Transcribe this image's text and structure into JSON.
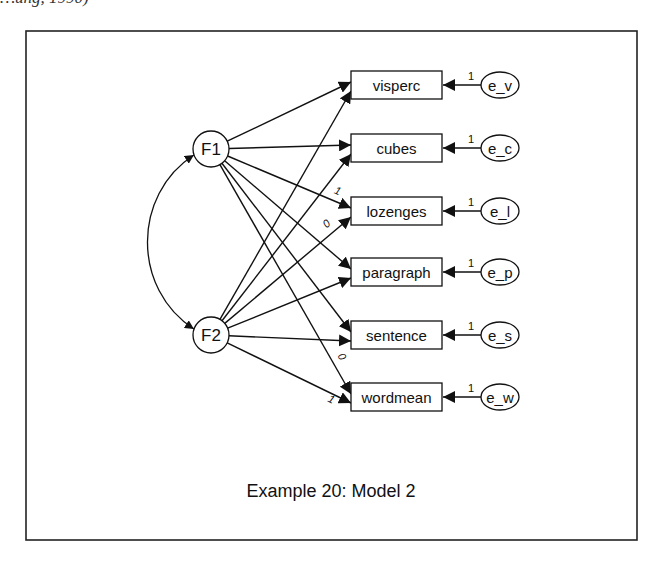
{
  "header_fragment": "…ung, 1990)",
  "caption": "Example 20: Model 2",
  "frame": {
    "x": 26,
    "y": 31,
    "w": 611,
    "h": 509
  },
  "factors": [
    {
      "id": "F1",
      "label": "F1",
      "cx": 211,
      "cy": 149,
      "r": 18
    },
    {
      "id": "F2",
      "label": "F2",
      "cx": 211,
      "cy": 335,
      "r": 18
    }
  ],
  "observed": [
    {
      "id": "visperc",
      "label": "visperc",
      "cy": 85,
      "error": "e_v"
    },
    {
      "id": "cubes",
      "label": "cubes",
      "cy": 148,
      "error": "e_c"
    },
    {
      "id": "lozenges",
      "label": "lozenges",
      "cy": 211,
      "error": "e_l"
    },
    {
      "id": "paragraph",
      "label": "paragraph",
      "cy": 272,
      "error": "e_p"
    },
    {
      "id": "sentence",
      "label": "sentence",
      "cy": 335,
      "error": "e_s"
    },
    {
      "id": "wordmean",
      "label": "wordmean",
      "cy": 397,
      "error": "e_w"
    }
  ],
  "box": {
    "x": 351,
    "w": 91,
    "h": 28
  },
  "error_ellipse": {
    "cx": 500,
    "rx": 19,
    "ry": 13
  },
  "error_path_label": "1",
  "paths": [
    {
      "from": "F1",
      "to": "visperc",
      "label": ""
    },
    {
      "from": "F1",
      "to": "cubes",
      "label": ""
    },
    {
      "from": "F1",
      "to": "lozenges",
      "label": "1"
    },
    {
      "from": "F1",
      "to": "paragraph",
      "label": ""
    },
    {
      "from": "F1",
      "to": "sentence",
      "label": ""
    },
    {
      "from": "F1",
      "to": "wordmean",
      "label": "0"
    },
    {
      "from": "F2",
      "to": "visperc",
      "label": ""
    },
    {
      "from": "F2",
      "to": "cubes",
      "label": ""
    },
    {
      "from": "F2",
      "to": "lozenges",
      "label": "0"
    },
    {
      "from": "F2",
      "to": "paragraph",
      "label": ""
    },
    {
      "from": "F2",
      "to": "sentence",
      "label": ""
    },
    {
      "from": "F2",
      "to": "wordmean",
      "label": "1"
    }
  ],
  "covariance": {
    "between": [
      "F1",
      "F2"
    ],
    "bulge_x": 142
  }
}
